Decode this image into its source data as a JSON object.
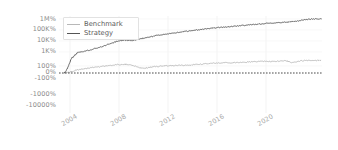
{
  "chart_data": {
    "type": "line",
    "title": "",
    "subtitle": "",
    "xlabel": "",
    "ylabel": "",
    "yscale": "symlog",
    "grid": true,
    "legend_position": "upper-left",
    "xlim": [
      2002.6,
      2022.6
    ],
    "ylim_labels": [
      "-10000%",
      "-1000%",
      "-100%",
      "0%",
      "100%",
      "1K%",
      "10K%",
      "100K%",
      "1M%"
    ],
    "ytick_labels": [
      "1M%",
      "100K%",
      "10K%",
      "1K%",
      "100%",
      "0%",
      "-100%",
      "-1000%",
      "-10000%"
    ],
    "ytick_values": [
      1000000,
      100000,
      10000,
      1000,
      100,
      0,
      -100,
      -1000,
      -10000
    ],
    "xtick_labels": [
      "2004",
      "2008",
      "2012",
      "2016",
      "2020"
    ],
    "xtick_values": [
      2004,
      2008,
      2012,
      2016,
      2020
    ],
    "zero_line_label": "0%",
    "series": [
      {
        "name": "Benchmark",
        "color": "#b8b8b8",
        "x": [
          2003.0,
          2003.2,
          2003.4,
          2003.6,
          2003.9,
          2004.2,
          2004.5,
          2004.8,
          2005.1,
          2005.4,
          2005.7,
          2006.0,
          2006.3,
          2006.6,
          2006.9,
          2007.2,
          2007.5,
          2007.8,
          2008.1,
          2008.4,
          2008.7,
          2009.0,
          2009.3,
          2009.6,
          2009.9,
          2010.3,
          2010.7,
          2011.1,
          2011.5,
          2011.9,
          2012.3,
          2012.7,
          2013.1,
          2013.5,
          2013.9,
          2014.3,
          2014.7,
          2015.1,
          2015.5,
          2015.9,
          2016.3,
          2016.7,
          2017.1,
          2017.5,
          2017.9,
          2018.3,
          2018.7,
          2019.1,
          2019.5,
          2019.9,
          2020.1,
          2020.3,
          2020.6,
          2021.0,
          2021.4,
          2021.8,
          2022.2,
          2022.5
        ],
        "values": [
          0,
          4,
          10,
          18,
          30,
          42,
          52,
          62,
          70,
          78,
          86,
          95,
          104,
          116,
          128,
          140,
          150,
          145,
          128,
          100,
          70,
          58,
          66,
          78,
          88,
          96,
          104,
          110,
          112,
          116,
          122,
          130,
          140,
          152,
          164,
          176,
          186,
          192,
          196,
          198,
          202,
          212,
          226,
          240,
          252,
          248,
          236,
          250,
          266,
          276,
          240,
          198,
          236,
          272,
          292,
          300,
          300,
          298
        ]
      },
      {
        "name": "Strategy",
        "color": "#555555",
        "x": [
          2003.0,
          2003.1,
          2003.25,
          2003.4,
          2003.55,
          2003.7,
          2003.85,
          2004.0,
          2004.2,
          2004.4,
          2004.6,
          2004.9,
          2005.2,
          2005.5,
          2005.8,
          2006.1,
          2006.4,
          2006.7,
          2007.0,
          2007.3,
          2007.6,
          2007.9,
          2008.2,
          2008.5,
          2008.8,
          2009.1,
          2009.4,
          2009.8,
          2010.2,
          2010.6,
          2011.0,
          2011.4,
          2011.8,
          2012.2,
          2012.6,
          2013.0,
          2013.4,
          2013.8,
          2014.2,
          2014.6,
          2015.0,
          2015.4,
          2015.8,
          2016.2,
          2016.6,
          2017.0,
          2017.4,
          2017.8,
          2018.2,
          2018.6,
          2019.0,
          2019.4,
          2019.8,
          2020.1,
          2020.4,
          2020.7,
          2021.0,
          2021.4,
          2021.8,
          2022.1,
          2022.4,
          2022.55
        ],
        "values": [
          0,
          15,
          60,
          180,
          420,
          520,
          700,
          900,
          1000,
          1050,
          1200,
          1500,
          1900,
          2400,
          3000,
          4000,
          5200,
          7000,
          9500,
          11000,
          12000,
          11500,
          11000,
          13000,
          16000,
          19000,
          23000,
          28000,
          34000,
          40000,
          47000,
          55000,
          64000,
          74000,
          85000,
          98000,
          112000,
          128000,
          146000,
          164000,
          180000,
          198000,
          216000,
          236000,
          260000,
          290000,
          320000,
          350000,
          385000,
          420000,
          440000,
          470000,
          510000,
          560000,
          600000,
          660000,
          760000,
          880000,
          980000,
          1000000,
          1020000,
          1030000
        ]
      }
    ],
    "zero_line": {
      "value": 0,
      "style": "dashed",
      "color": "#4a4a4a"
    }
  },
  "legend": {
    "items": [
      {
        "label": "Benchmark",
        "color": "#b8b8b8"
      },
      {
        "label": "Strategy",
        "color": "#555555"
      }
    ]
  },
  "axes": {
    "y_ticks": [
      {
        "label": "1M%",
        "y": 19
      },
      {
        "label": "100K%",
        "y": 29
      },
      {
        "label": "10K%",
        "y": 40
      },
      {
        "label": "1K%",
        "y": 51
      },
      {
        "label": "100%",
        "y": 66
      },
      {
        "label": "0%",
        "y": 72
      },
      {
        "label": "-100%",
        "y": 78
      },
      {
        "label": "-1000%",
        "y": 94
      },
      {
        "label": "-10000%",
        "y": 105
      }
    ],
    "x_ticks": [
      {
        "label": "2004",
        "x": 76
      },
      {
        "label": "2008",
        "x": 124
      },
      {
        "label": "2012",
        "x": 173
      },
      {
        "label": "2016",
        "x": 222
      },
      {
        "label": "2020",
        "x": 271
      }
    ]
  }
}
